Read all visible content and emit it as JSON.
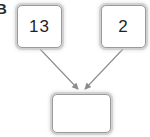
{
  "figure": {
    "label": "B",
    "background_color": "#ffffff",
    "box_border_color": "#9a9a9a",
    "box_glow_color": "#c8c8c8",
    "arrow_color": "#8c8c8c",
    "text_color": "#1f1f1f"
  },
  "diagram": {
    "type": "binary-operation-tree",
    "nodes": [
      {
        "id": "left-operand",
        "value": "13",
        "empty": false
      },
      {
        "id": "right-operand",
        "value": "2",
        "empty": false
      },
      {
        "id": "result",
        "value": "",
        "empty": true
      }
    ],
    "edges": [
      {
        "from": "left-operand",
        "to": "result",
        "style": "arrow"
      },
      {
        "from": "right-operand",
        "to": "result",
        "style": "arrow"
      }
    ]
  }
}
